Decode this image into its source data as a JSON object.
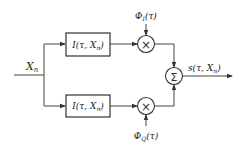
{
  "diagram": {
    "type": "block-diagram",
    "input": {
      "label": "X",
      "subscript": "n"
    },
    "branches": [
      {
        "id": "upper",
        "block": {
          "label_main": "I(τ, X",
          "label_sub": "n",
          "label_end": ")"
        },
        "multiplier": {
          "symbol": "×"
        },
        "carrier": {
          "label_main": "Φ",
          "label_sub": "I",
          "label_end": "(τ)"
        }
      },
      {
        "id": "lower",
        "block": {
          "label_main": "I(τ, X",
          "label_sub": "n",
          "label_end": ")"
        },
        "multiplier": {
          "symbol": "×"
        },
        "carrier": {
          "label_main": "Φ",
          "label_sub": "Q",
          "label_end": "(τ)"
        }
      }
    ],
    "summer": {
      "symbol": "Σ"
    },
    "output": {
      "label_main": "s(τ, X",
      "label_sub": "n",
      "label_end": ")"
    },
    "colors": {
      "stroke": "#333333",
      "background": "#ffffff",
      "text": "#222222"
    }
  }
}
